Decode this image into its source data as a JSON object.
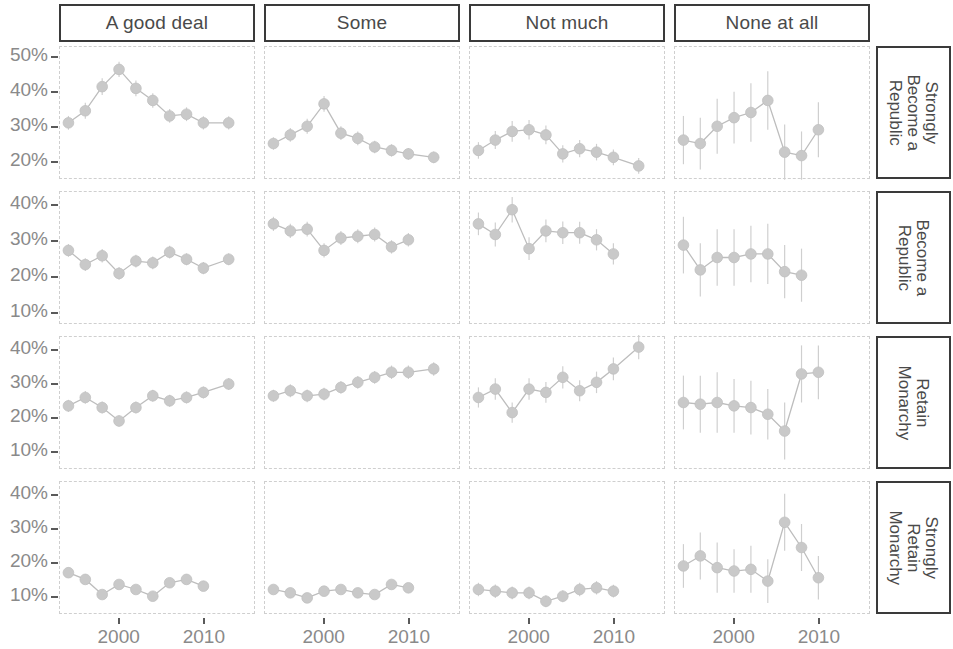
{
  "chart_data": {
    "type": "line",
    "title": "",
    "subtitle": "",
    "xlabel": "",
    "ylabel": "",
    "grid": false,
    "legend": "none",
    "marker": "circle-with-errorbars",
    "colors": {
      "marker": "#c9c9c9",
      "line": "#bdbdbd",
      "errorbar": "#cfcfcf",
      "strip_border": "#3a3a3a",
      "panel_border": "#cfcfcf",
      "axis_text": "#8a8a8a",
      "strip_text": "#4a4a4a"
    },
    "facet_columns": [
      "A good deal",
      "Some",
      "Not much",
      "None at all"
    ],
    "facet_rows": [
      "Strongly Become a Republic",
      "Become a Republic",
      "Retain Monarchy",
      "Strongly Retain Monarchy"
    ],
    "facet_rows_display": [
      "Strongly\nBecome a\nRepublic",
      "Become a\nRepublic",
      "Retain\nMonarchy",
      "Strongly\nRetain\nMonarchy"
    ],
    "x": [
      1994,
      1996,
      1998,
      2000,
      2002,
      2004,
      2006,
      2008,
      2010,
      2013,
      2015
    ],
    "xlim": [
      1993,
      2016
    ],
    "xticks": [
      2000,
      2010
    ],
    "xtick_labels": [
      "2000",
      "2010"
    ],
    "row_ylim": [
      [
        15,
        53
      ],
      [
        7,
        44
      ],
      [
        5,
        44
      ],
      [
        5,
        44
      ]
    ],
    "row_yticks": [
      [
        20,
        30,
        40,
        50
      ],
      [
        10,
        20,
        30,
        40
      ],
      [
        10,
        20,
        30,
        40
      ],
      [
        10,
        20,
        30,
        40
      ]
    ],
    "row_ytick_labels": [
      [
        "20%",
        "30%",
        "40%",
        "50%"
      ],
      [
        "10%",
        "20%",
        "30%",
        "40%"
      ],
      [
        "10%",
        "20%",
        "30%",
        "40%"
      ],
      [
        "10%",
        "20%",
        "30%",
        "40%"
      ]
    ],
    "panels": [
      {
        "row": "Strongly Become a Republic",
        "col": "A good deal",
        "x": [
          1994,
          1996,
          1998,
          2000,
          2002,
          2004,
          2006,
          2008,
          2010,
          2013
        ],
        "values": [
          31.0,
          34.5,
          41.5,
          46.5,
          41.0,
          37.5,
          33.0,
          33.5,
          31.0,
          31.0
        ],
        "err": [
          2.0,
          2.3,
          2.4,
          2.2,
          2.3,
          2.1,
          2.0,
          2.0,
          1.9,
          1.9
        ]
      },
      {
        "row": "Strongly Become a Republic",
        "col": "Some",
        "x": [
          1994,
          1996,
          1998,
          2000,
          2002,
          2004,
          2006,
          2008,
          2010,
          2013
        ],
        "values": [
          25.0,
          27.5,
          30.0,
          36.5,
          28.0,
          26.5,
          24.0,
          23.0,
          22.0,
          21.0
        ],
        "err": [
          1.8,
          2.0,
          2.2,
          2.3,
          2.0,
          2.0,
          1.8,
          1.8,
          1.7,
          1.7
        ]
      },
      {
        "row": "Strongly Become a Republic",
        "col": "Not much",
        "x": [
          1994,
          1996,
          1998,
          2000,
          2002,
          2004,
          2006,
          2008,
          2010,
          2013
        ],
        "values": [
          23.0,
          26.0,
          28.5,
          29.0,
          27.5,
          22.0,
          23.5,
          22.5,
          21.0,
          18.5
        ],
        "err": [
          2.4,
          2.6,
          3.0,
          2.8,
          2.7,
          2.5,
          2.5,
          2.4,
          2.3,
          2.3
        ]
      },
      {
        "row": "Strongly Become a Republic",
        "col": "None at all",
        "x": [
          1994,
          1996,
          1998,
          2000,
          2002,
          2004,
          2006,
          2008,
          2010,
          2013
        ],
        "values": [
          26.0,
          25.0,
          30.0,
          32.5,
          34.0,
          37.5,
          22.5,
          21.5,
          29.0
        ],
        "err": [
          7.0,
          7.5,
          8.0,
          7.5,
          8.5,
          8.5,
          8.0,
          7.0,
          8.0
        ]
      },
      {
        "row": "Become a Republic",
        "col": "A good deal",
        "x": [
          1994,
          1996,
          1998,
          2000,
          2002,
          2004,
          2006,
          2008,
          2010,
          2013
        ],
        "values": [
          27.5,
          23.5,
          26.0,
          21.0,
          24.5,
          24.0,
          27.0,
          25.0,
          22.5,
          25.0
        ],
        "err": [
          1.8,
          1.8,
          1.9,
          1.8,
          1.8,
          1.8,
          1.8,
          1.7,
          1.7,
          1.7
        ]
      },
      {
        "row": "Become a Republic",
        "col": "Some",
        "x": [
          1994,
          1996,
          1998,
          2000,
          2002,
          2004,
          2006,
          2008,
          2010,
          2013
        ],
        "values": [
          35.0,
          33.0,
          33.5,
          27.5,
          31.0,
          31.5,
          32.0,
          28.5,
          30.5
        ],
        "err": [
          2.0,
          2.0,
          2.1,
          2.0,
          2.0,
          2.0,
          2.0,
          1.9,
          1.9
        ]
      },
      {
        "row": "Become a Republic",
        "col": "Not much",
        "x": [
          1994,
          1996,
          1998,
          2000,
          2002,
          2004,
          2006,
          2008,
          2010,
          2013
        ],
        "values": [
          35.0,
          32.0,
          39.0,
          28.0,
          33.0,
          32.5,
          32.5,
          30.5,
          26.5
        ],
        "err": [
          3.2,
          3.4,
          3.6,
          3.2,
          3.2,
          3.2,
          3.1,
          3.0,
          3.0
        ]
      },
      {
        "row": "Become a Republic",
        "col": "None at all",
        "x": [
          1994,
          1996,
          1998,
          2000,
          2002,
          2004,
          2006,
          2008,
          2010,
          2013
        ],
        "values": [
          29.0,
          22.0,
          25.5,
          25.5,
          26.5,
          26.5,
          21.5,
          20.5
        ],
        "err": [
          8.0,
          7.5,
          8.0,
          8.0,
          8.0,
          8.5,
          7.5,
          7.5
        ]
      },
      {
        "row": "Retain Monarchy",
        "col": "A good deal",
        "x": [
          1994,
          1996,
          1998,
          2000,
          2002,
          2004,
          2006,
          2008,
          2010,
          2013
        ],
        "values": [
          23.5,
          26.0,
          23.0,
          19.0,
          23.0,
          26.5,
          25.0,
          26.0,
          27.5,
          30.0
        ],
        "err": [
          1.8,
          1.9,
          1.8,
          1.7,
          1.8,
          1.8,
          1.8,
          1.8,
          1.8,
          1.8
        ]
      },
      {
        "row": "Retain Monarchy",
        "col": "Some",
        "x": [
          1994,
          1996,
          1998,
          2000,
          2002,
          2004,
          2006,
          2008,
          2010,
          2013
        ],
        "values": [
          26.5,
          28.0,
          26.5,
          27.0,
          29.0,
          30.5,
          32.0,
          33.5,
          33.5,
          34.5
        ],
        "err": [
          1.8,
          1.9,
          1.9,
          1.9,
          1.9,
          1.9,
          1.9,
          2.0,
          2.0,
          2.0
        ]
      },
      {
        "row": "Retain Monarchy",
        "col": "Not much",
        "x": [
          1994,
          1996,
          1998,
          2000,
          2002,
          2004,
          2006,
          2008,
          2010,
          2013
        ],
        "values": [
          26.0,
          28.5,
          21.5,
          28.5,
          27.5,
          32.0,
          28.0,
          30.5,
          34.5,
          41.0
        ],
        "err": [
          3.0,
          3.2,
          3.0,
          3.2,
          3.1,
          3.3,
          3.1,
          3.2,
          3.4,
          3.6
        ]
      },
      {
        "row": "Retain Monarchy",
        "col": "None at all",
        "x": [
          1994,
          1996,
          1998,
          2000,
          2002,
          2004,
          2006,
          2008,
          2010,
          2013
        ],
        "values": [
          24.5,
          24.0,
          24.5,
          23.5,
          23.0,
          21.0,
          16.0,
          33.0,
          33.5
        ],
        "err": [
          8.0,
          8.5,
          9.0,
          8.0,
          8.0,
          7.5,
          8.5,
          8.5,
          8.0
        ]
      },
      {
        "row": "Strongly Retain Monarchy",
        "col": "A good deal",
        "x": [
          1994,
          1996,
          1998,
          2000,
          2002,
          2004,
          2006,
          2008,
          2010,
          2013
        ],
        "values": [
          17.0,
          15.0,
          10.5,
          13.5,
          12.0,
          10.0,
          14.0,
          15.0,
          13.0
        ],
        "err": [
          1.5,
          1.4,
          1.2,
          1.3,
          1.3,
          1.2,
          1.4,
          1.4,
          1.3
        ]
      },
      {
        "row": "Strongly Retain Monarchy",
        "col": "Some",
        "x": [
          1994,
          1996,
          1998,
          2000,
          2002,
          2004,
          2006,
          2008,
          2010,
          2013
        ],
        "values": [
          12.0,
          11.0,
          9.5,
          11.5,
          12.0,
          11.0,
          10.5,
          13.5,
          12.5
        ],
        "err": [
          1.3,
          1.2,
          1.2,
          1.2,
          1.3,
          1.2,
          1.2,
          1.4,
          1.3
        ]
      },
      {
        "row": "Strongly Retain Monarchy",
        "col": "Not much",
        "x": [
          1994,
          1996,
          1998,
          2000,
          2002,
          2004,
          2006,
          2008,
          2010,
          2013
        ],
        "values": [
          12.0,
          11.5,
          11.0,
          11.0,
          8.5,
          10.0,
          12.0,
          12.5,
          11.5
        ],
        "err": [
          2.0,
          2.0,
          1.9,
          1.9,
          1.8,
          1.8,
          2.0,
          2.0,
          1.9
        ]
      },
      {
        "row": "Strongly Retain Monarchy",
        "col": "None at all",
        "x": [
          1994,
          1996,
          1998,
          2000,
          2002,
          2004,
          2006,
          2008,
          2010,
          2013
        ],
        "values": [
          19.0,
          22.0,
          18.5,
          17.5,
          18.0,
          14.5,
          32.0,
          24.5,
          15.5
        ],
        "err": [
          6.5,
          7.0,
          7.5,
          6.5,
          7.0,
          6.5,
          8.5,
          7.0,
          6.5
        ]
      }
    ]
  }
}
